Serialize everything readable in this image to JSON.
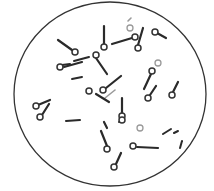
{
  "figure": {
    "title": "Microscopic field with drumstick-shaped bacilli bearing terminal spores",
    "field": {
      "cx": 110,
      "cy": 94,
      "rx": 96,
      "ry": 92,
      "stroke": "#333333"
    },
    "colors": {
      "rod": "#2a2a2a",
      "light_rod": "#9a9a9a",
      "spore_stroke": "#333333",
      "background": "#ffffff"
    },
    "bacilli": [
      {
        "x1": 104,
        "y1": 26,
        "x2": 104,
        "y2": 44,
        "spore": [
          104,
          47
        ]
      },
      {
        "x1": 58,
        "y1": 40,
        "x2": 72,
        "y2": 50,
        "spore": [
          75,
          52
        ]
      },
      {
        "x1": 82,
        "y1": 62,
        "x2": 64,
        "y2": 67,
        "spore": [
          60,
          67
        ]
      },
      {
        "x1": 107,
        "y1": 74,
        "x2": 96,
        "y2": 58,
        "spore": [
          96,
          55
        ]
      },
      {
        "x1": 112,
        "y1": 44,
        "x2": 132,
        "y2": 38,
        "spore": [
          135,
          37
        ]
      },
      {
        "x1": 143,
        "y1": 28,
        "x2": 138,
        "y2": 45,
        "spore": [
          138,
          48
        ]
      },
      {
        "x1": 166,
        "y1": 38,
        "x2": 157,
        "y2": 33,
        "spore": [
          155,
          32
        ]
      },
      {
        "x1": 121,
        "y1": 76,
        "x2": 106,
        "y2": 88,
        "spore": [
          103,
          90
        ]
      },
      {
        "x1": 109,
        "y1": 102,
        "x2": 96,
        "y2": 94,
        "spore": [
          89,
          91
        ]
      },
      {
        "x1": 144,
        "y1": 89,
        "x2": 151,
        "y2": 74,
        "spore": [
          152,
          71
        ]
      },
      {
        "x1": 122,
        "y1": 98,
        "x2": 122,
        "y2": 113,
        "spore": [
          122,
          116
        ]
      },
      {
        "x1": 156,
        "y1": 86,
        "x2": 150,
        "y2": 95,
        "spore": [
          148,
          98
        ]
      },
      {
        "x1": 178,
        "y1": 82,
        "x2": 173,
        "y2": 92,
        "spore": [
          172,
          95
        ]
      },
      {
        "x1": 50,
        "y1": 100,
        "x2": 38,
        "y2": 105,
        "spore": [
          36,
          106
        ]
      },
      {
        "x1": 49,
        "y1": 104,
        "x2": 42,
        "y2": 115,
        "spore": [
          40,
          117
        ]
      },
      {
        "x1": 107,
        "y1": 128,
        "x2": 104,
        "y2": 122,
        "spore": [
          122,
          120
        ]
      },
      {
        "x1": 101,
        "y1": 131,
        "x2": 107,
        "y2": 146,
        "spore": [
          107,
          149
        ]
      },
      {
        "x1": 158,
        "y1": 148,
        "x2": 137,
        "y2": 147,
        "spore": [
          133,
          146
        ]
      },
      {
        "x1": 121,
        "y1": 153,
        "x2": 116,
        "y2": 164,
        "spore": [
          114,
          167
        ]
      }
    ],
    "plain_rods": [
      {
        "x1": 72,
        "y1": 79,
        "x2": 82,
        "y2": 77
      },
      {
        "x1": 74,
        "y1": 61,
        "x2": 89,
        "y2": 57
      },
      {
        "x1": 128,
        "y1": 21,
        "x2": 131,
        "y2": 18,
        "light": true
      },
      {
        "x1": 66,
        "y1": 121,
        "x2": 80,
        "y2": 120
      },
      {
        "x1": 119,
        "y1": 122,
        "x2": 124,
        "y2": 121
      },
      {
        "x1": 174,
        "y1": 133,
        "x2": 178,
        "y2": 131
      },
      {
        "x1": 163,
        "y1": 134,
        "x2": 171,
        "y2": 129
      },
      {
        "x1": 182,
        "y1": 141,
        "x2": 180,
        "y2": 148
      },
      {
        "x1": 105,
        "y1": 98,
        "x2": 115,
        "y2": 90,
        "light": true
      },
      {
        "x1": 62,
        "y1": 65,
        "x2": 70,
        "y2": 64
      }
    ],
    "free_spores": [
      [
        158,
        63
      ],
      [
        140,
        128
      ],
      [
        130,
        28
      ]
    ]
  }
}
